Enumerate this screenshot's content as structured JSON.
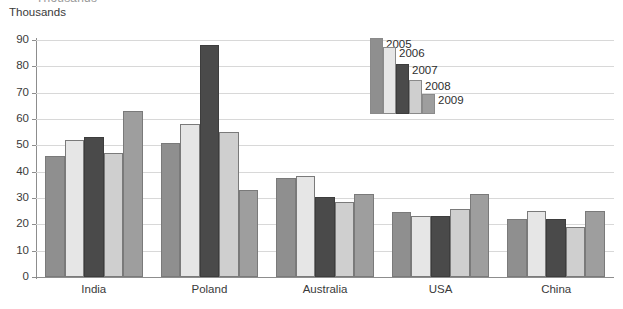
{
  "title_sliver": "Thousands",
  "units_label": "Thousands",
  "axis": {
    "y_ticks": [
      0,
      10,
      20,
      30,
      40,
      50,
      60,
      70,
      80,
      90
    ],
    "y_min": 0,
    "y_max": 90
  },
  "legend": {
    "entries": [
      {
        "label": "2005",
        "color": "#8f8f8f"
      },
      {
        "label": "2006",
        "color": "#e6e6e6"
      },
      {
        "label": "2007",
        "color": "#4a4a4a"
      },
      {
        "label": "2008",
        "color": "#cfcfcf"
      },
      {
        "label": "2009",
        "color": "#9e9e9e"
      }
    ]
  },
  "chart_data": {
    "type": "bar",
    "title": "Thousands",
    "xlabel": "",
    "ylabel": "Thousands",
    "ylim": [
      0,
      90
    ],
    "ytick_step": 10,
    "grid": true,
    "legend_position": "top-right-inside",
    "categories": [
      "India",
      "Poland",
      "Australia",
      "USA",
      "China"
    ],
    "series": [
      {
        "name": "2005",
        "color": "#8f8f8f",
        "values": [
          46,
          51,
          37.5,
          24.5,
          22
        ]
      },
      {
        "name": "2006",
        "color": "#e6e6e6",
        "values": [
          52,
          58,
          38.5,
          23,
          25
        ]
      },
      {
        "name": "2007",
        "color": "#4a4a4a",
        "values": [
          53,
          88,
          30.5,
          23,
          22
        ]
      },
      {
        "name": "2008",
        "color": "#cfcfcf",
        "values": [
          47,
          55,
          28.5,
          26,
          19
        ]
      },
      {
        "name": "2009",
        "color": "#9e9e9e",
        "values": [
          63,
          33,
          31.5,
          31.5,
          25
        ]
      }
    ]
  },
  "colors": {
    "axis": "#8d8d8d",
    "gridline": "#d8d8d8",
    "text": "#3a3a3a",
    "background": "#ffffff",
    "bar_outline": "#7a7a7a"
  }
}
